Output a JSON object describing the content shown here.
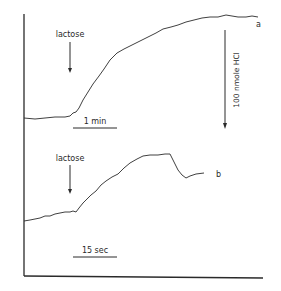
{
  "figure": {
    "colors": {
      "ink": "#2a2a2a",
      "background": "#ffffff"
    },
    "trace_a": {
      "label": "a",
      "stimulus": "lactose",
      "scale_bar": "1 min",
      "calibration": "100 nmole HCl"
    },
    "trace_b": {
      "label": "b",
      "stimulus": "lactose",
      "scale_bar": "15 sec"
    }
  }
}
